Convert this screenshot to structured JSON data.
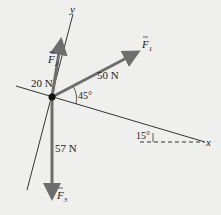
{
  "diagram": {
    "axes": {
      "x_label": "x",
      "y_label": "y",
      "tilt_angle_label": "15°"
    },
    "forces": [
      {
        "id": "F1",
        "symbol": "F",
        "subscript": "1",
        "magnitude_label": "50 N",
        "angle_label": "45°"
      },
      {
        "id": "F2",
        "symbol": "F",
        "subscript": "2",
        "magnitude_label": "20 N"
      },
      {
        "id": "F3",
        "symbol": "F",
        "subscript": "3",
        "magnitude_label": "57 N"
      }
    ],
    "colors": {
      "background": "#efefed",
      "axis_line": "#333333",
      "force_arrow": "#6e6e6e",
      "origin_dot": "#111111",
      "text": "#222222"
    }
  }
}
